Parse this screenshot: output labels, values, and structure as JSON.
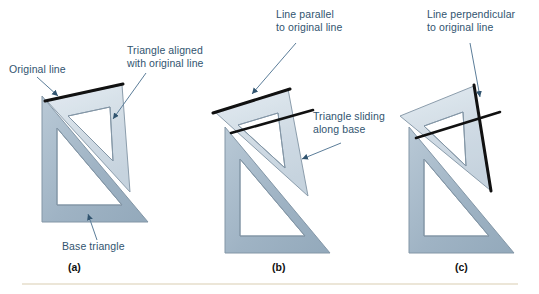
{
  "figure": {
    "background": "#ffffff",
    "label_color": "#31546f",
    "panel_letter_color": "#111111",
    "rule_color": "#ece6d8",
    "base_triangle_fill": "#9fb3c4",
    "base_triangle_fill_light": "#b9c9d6",
    "moving_triangle_fill": "#ccd8e2",
    "moving_triangle_fill_light": "#e2eaf1",
    "outline_color": "#8396a6",
    "drawn_line_color": "#111111",
    "leader_color": "#5b7d99"
  },
  "callouts": {
    "original_line": "Original line",
    "triangle_aligned": "Triangle aligned\nwith original line",
    "line_parallel": "Line parallel\nto original line",
    "triangle_sliding": "Triangle sliding\nalong base",
    "line_perpendicular": "Line perpendicular\nto original line",
    "base_triangle": "Base triangle"
  },
  "panels": [
    {
      "letter": "(a)"
    },
    {
      "letter": "(b)"
    },
    {
      "letter": "(c)"
    }
  ],
  "geometry": {
    "panel_a": {
      "base": "42,222 148,222 42,96",
      "base_hole": "57,205 122,205 57,128",
      "moving": "47,101 122,85 130,192",
      "moving_hole": "68,116 110,107 113,161",
      "drawn_line": "46,101 122,85"
    },
    "panel_b": {
      "base": "225,253 330,253 225,127",
      "base_hole": "240,236 305,236 240,159",
      "moving": "215,112 288,89 308,196",
      "moving_hole": "238,125 278,113 285,168",
      "drawn_line": "214,113 289,90",
      "parallel_line": "232,132 311,111"
    },
    "panel_c": {
      "base": "409,253 514,253 409,127",
      "base_hole": "424,236 489,236 424,159",
      "moving": "400,116 474,86 490,190",
      "moving_hole": "424,126 463,112 466,166",
      "drawn_line": "474,86 490,190",
      "perp_line": "417,137 498,113"
    }
  }
}
